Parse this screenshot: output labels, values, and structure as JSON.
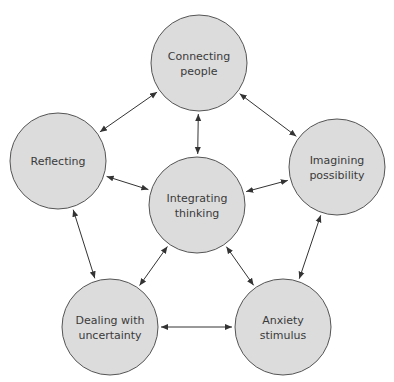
{
  "diagram": {
    "type": "cycle-network",
    "nodes": [
      {
        "id": "connecting",
        "lines": [
          "Connecting",
          "people"
        ],
        "cx": 199,
        "cy": 63,
        "r": 48
      },
      {
        "id": "reflecting",
        "lines": [
          "Reflecting"
        ],
        "cx": 58,
        "cy": 161,
        "r": 48
      },
      {
        "id": "imagining",
        "lines": [
          "Imagining",
          "possibility"
        ],
        "cx": 337,
        "cy": 167,
        "r": 48
      },
      {
        "id": "integrating",
        "lines": [
          "Integrating",
          "thinking"
        ],
        "cx": 197,
        "cy": 205,
        "r": 48
      },
      {
        "id": "dealing",
        "lines": [
          "Dealing with",
          "uncertainty"
        ],
        "cx": 110,
        "cy": 327,
        "r": 48
      },
      {
        "id": "anxiety",
        "lines": [
          "Anxiety",
          "stimulus"
        ],
        "cx": 283,
        "cy": 327,
        "r": 48
      }
    ],
    "edges": [
      {
        "from": "connecting",
        "to": "reflecting",
        "bidirectional": true
      },
      {
        "from": "connecting",
        "to": "imagining",
        "bidirectional": true
      },
      {
        "from": "connecting",
        "to": "integrating",
        "bidirectional": true
      },
      {
        "from": "reflecting",
        "to": "integrating",
        "bidirectional": true
      },
      {
        "from": "imagining",
        "to": "integrating",
        "bidirectional": true
      },
      {
        "from": "reflecting",
        "to": "dealing",
        "bidirectional": true
      },
      {
        "from": "imagining",
        "to": "anxiety",
        "bidirectional": true
      },
      {
        "from": "integrating",
        "to": "dealing",
        "bidirectional": true
      },
      {
        "from": "integrating",
        "to": "anxiety",
        "bidirectional": true
      },
      {
        "from": "dealing",
        "to": "anxiety",
        "bidirectional": true
      }
    ],
    "colors": {
      "node_fill": "#dcdcdc",
      "node_stroke": "#555555",
      "edge": "#333333",
      "text": "#3a3a3a",
      "background": "#ffffff"
    }
  }
}
